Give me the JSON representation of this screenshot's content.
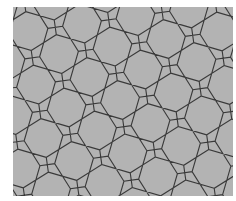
{
  "image": {
    "width": 236,
    "height": 201,
    "background": "#ffffff"
  },
  "tiling": {
    "type": "cairo-pentagonal",
    "construction": "overlay of two perpendicular elongated hexagonal tilings",
    "region": {
      "x": 13,
      "y": 7,
      "width": 220,
      "height": 189
    },
    "fill_color": "#b3b3b3",
    "stroke_color": "#3a3a3a",
    "stroke_width": 1.1,
    "unit_t": 27,
    "edge_w_ratio": 0.55,
    "rotation_deg": -8,
    "origin": {
      "x": 120,
      "y": 100
    }
  }
}
